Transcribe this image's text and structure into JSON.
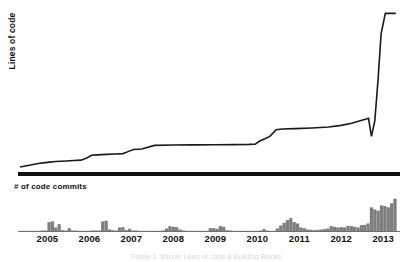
{
  "figure": {
    "top_panel_label": "Lines of code",
    "bottom_panel_label": "# of code commits",
    "caption": "Figure 1. Bitcoin Lines of code & Building Blocks"
  },
  "chart_data": [
    {
      "type": "line",
      "title": "",
      "ylabel": "Lines of code",
      "xlabel": "",
      "grid": false,
      "legend": "none",
      "xlim": [
        2004.3,
        2013.4
      ],
      "ylim": [
        0,
        1
      ],
      "xticks": [
        2005,
        2006,
        2007,
        2008,
        2009,
        2010,
        2011,
        2012,
        2013
      ],
      "xtick_labels": [
        "2005",
        "2006",
        "2007",
        "2008",
        "2009",
        "2010",
        "2011",
        "2012",
        "2013"
      ],
      "note": "Step-like slow growth 2005-2012 then near-vertical rise in 2013; a sharp downward spike just before the final climb",
      "series": [
        {
          "name": "Lines of code",
          "x": [
            2004.35,
            2004.6,
            2004.78,
            2004.95,
            2005.05,
            2005.2,
            2005.45,
            2005.62,
            2005.8,
            2005.95,
            2006.05,
            2006.2,
            2006.4,
            2006.62,
            2006.8,
            2006.92,
            2007.05,
            2007.25,
            2007.55,
            2008.0,
            2008.5,
            2009.0,
            2009.45,
            2009.8,
            2009.95,
            2010.05,
            2010.18,
            2010.3,
            2010.45,
            2010.6,
            2010.9,
            2011.3,
            2011.7,
            2012.0,
            2012.25,
            2012.45,
            2012.58,
            2012.65,
            2012.72,
            2012.8,
            2012.88,
            2012.95,
            2013.05,
            2013.3
          ],
          "y": [
            0.018,
            0.03,
            0.04,
            0.045,
            0.048,
            0.052,
            0.055,
            0.058,
            0.06,
            0.075,
            0.09,
            0.092,
            0.095,
            0.098,
            0.1,
            0.112,
            0.125,
            0.128,
            0.15,
            0.152,
            0.153,
            0.154,
            0.155,
            0.156,
            0.158,
            0.175,
            0.19,
            0.205,
            0.245,
            0.25,
            0.252,
            0.256,
            0.262,
            0.272,
            0.285,
            0.3,
            0.31,
            0.315,
            0.205,
            0.3,
            0.56,
            0.83,
            0.955,
            0.955
          ]
        }
      ]
    },
    {
      "type": "bar",
      "title": "",
      "ylabel": "# of code commits",
      "xlabel": "",
      "grid": false,
      "legend": "none",
      "bar_color": "#7e7e7e",
      "xlim": [
        2004.3,
        2013.4
      ],
      "ylim": [
        0,
        1
      ],
      "xticks": [
        2005,
        2006,
        2007,
        2008,
        2009,
        2010,
        2011,
        2012,
        2013
      ],
      "xtick_labels": [
        "2005",
        "2006",
        "2007",
        "2008",
        "2009",
        "2010",
        "2011",
        "2012",
        "2013"
      ],
      "x": [
        2004.4,
        2004.48,
        2004.56,
        2004.64,
        2004.72,
        2004.8,
        2004.88,
        2004.96,
        2005.04,
        2005.12,
        2005.2,
        2005.28,
        2005.36,
        2005.44,
        2005.52,
        2005.6,
        2005.68,
        2005.76,
        2005.84,
        2005.92,
        2006.0,
        2006.08,
        2006.16,
        2006.24,
        2006.32,
        2006.4,
        2006.48,
        2006.56,
        2006.64,
        2006.72,
        2006.8,
        2006.88,
        2006.96,
        2007.04,
        2007.12,
        2007.2,
        2007.28,
        2007.36,
        2007.44,
        2007.52,
        2007.6,
        2007.68,
        2007.76,
        2007.84,
        2007.92,
        2008.0,
        2008.08,
        2008.16,
        2008.24,
        2008.32,
        2008.4,
        2008.48,
        2008.56,
        2008.64,
        2008.72,
        2008.8,
        2008.88,
        2008.96,
        2009.04,
        2009.12,
        2009.2,
        2009.28,
        2009.36,
        2009.44,
        2009.52,
        2009.6,
        2009.68,
        2009.76,
        2009.84,
        2009.92,
        2010.0,
        2010.08,
        2010.16,
        2010.24,
        2010.32,
        2010.4,
        2010.48,
        2010.56,
        2010.64,
        2010.72,
        2010.8,
        2010.88,
        2010.96,
        2011.04,
        2011.12,
        2011.2,
        2011.28,
        2011.36,
        2011.44,
        2011.52,
        2011.6,
        2011.68,
        2011.76,
        2011.84,
        2011.92,
        2012.0,
        2012.08,
        2012.16,
        2012.24,
        2012.32,
        2012.4,
        2012.48,
        2012.56,
        2012.64,
        2012.72,
        2012.8,
        2012.88,
        2012.96,
        2013.04,
        2013.12,
        2013.2,
        2013.28
      ],
      "values": [
        0.02,
        0.02,
        0.02,
        0.02,
        0.02,
        0.02,
        0.03,
        0.03,
        0.28,
        0.3,
        0.12,
        0.22,
        0.04,
        0.03,
        0.1,
        0.03,
        0.03,
        0.02,
        0.02,
        0.02,
        0.02,
        0.03,
        0.03,
        0.03,
        0.3,
        0.32,
        0.06,
        0.04,
        0.03,
        0.12,
        0.13,
        0.04,
        0.08,
        0.03,
        0.03,
        0.02,
        0.02,
        0.02,
        0.02,
        0.02,
        0.02,
        0.02,
        0.03,
        0.09,
        0.16,
        0.14,
        0.13,
        0.06,
        0.03,
        0.02,
        0.02,
        0.02,
        0.02,
        0.02,
        0.02,
        0.02,
        0.1,
        0.1,
        0.08,
        0.16,
        0.14,
        0.04,
        0.03,
        0.02,
        0.02,
        0.02,
        0.02,
        0.02,
        0.02,
        0.02,
        0.02,
        0.03,
        0.07,
        0.03,
        0.02,
        0.02,
        0.09,
        0.18,
        0.26,
        0.34,
        0.4,
        0.28,
        0.24,
        0.12,
        0.1,
        0.06,
        0.05,
        0.04,
        0.05,
        0.06,
        0.07,
        0.09,
        0.16,
        0.14,
        0.12,
        0.13,
        0.12,
        0.17,
        0.16,
        0.14,
        0.12,
        0.19,
        0.2,
        0.24,
        0.72,
        0.66,
        0.62,
        0.78,
        0.76,
        0.72,
        0.84,
        0.98,
        0.95
      ]
    }
  ]
}
